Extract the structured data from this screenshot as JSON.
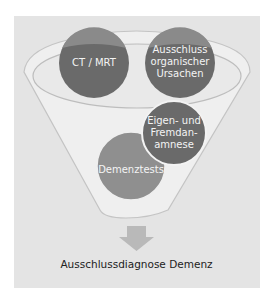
{
  "diagram": {
    "nodes": [
      {
        "id": "ct-mrt",
        "label": "CT / MRT"
      },
      {
        "id": "ausschluss",
        "label": "Ausschluss organischer Ursachen",
        "lines": [
          "Ausschluss",
          "organischer",
          "Ursachen"
        ]
      },
      {
        "id": "anamnese",
        "label": "Eigen- und Fremdanamnese",
        "lines": [
          "Eigen- und",
          "Fremdan-",
          "amnese"
        ]
      },
      {
        "id": "demenztests",
        "label": "Demenztests"
      }
    ],
    "result": "Ausschlussdiagnose Demenz",
    "colors": {
      "panel": "#e4e4e4",
      "funnel_fill": "#eeeeee",
      "funnel_stroke": "#bdbdbd",
      "circle_dark": "#6a6a6a",
      "circle_light": "#8f8f8f",
      "arrow": "#b9b9b9",
      "text_light": "#f4f4f4",
      "text_dark": "#222222"
    }
  }
}
